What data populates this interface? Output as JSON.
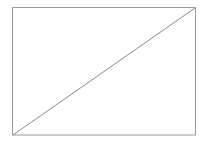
{
  "diagram": {
    "shapes": [
      {
        "type": "rectangle",
        "x": 12.5,
        "y": 7.5,
        "width": 183,
        "height": 127.5,
        "stroke": "#9a9a9a",
        "fill": "#ffffff"
      },
      {
        "type": "line",
        "x1": 13,
        "y1": 135,
        "x2": 195,
        "y2": 8,
        "stroke": "#8c8c8c"
      }
    ]
  }
}
